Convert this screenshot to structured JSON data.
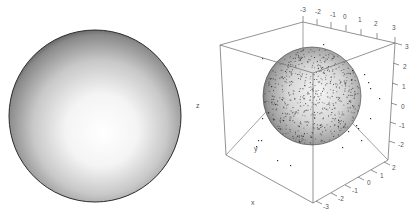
{
  "figure": {
    "panels": 2,
    "left_panel": {
      "description": "shaded sphere surface"
    },
    "right_panel": {
      "description": "3D scatter of points inside translucent sphere within bounding box"
    }
  },
  "colors": {
    "box_line": "#777777",
    "tick_text": "#555555",
    "point": "#333333",
    "sphere_highlight": "#ffffff",
    "sphere_shadow": "#3a3a3a"
  },
  "chart_data": [
    {
      "type": "surface",
      "title": "",
      "shape": "sphere",
      "shading": "grayscale lit from front-center"
    },
    {
      "type": "scatter",
      "title": "",
      "dimensions": 3,
      "overlay": "sphere of radius ~2 centered at origin",
      "xlabel": "x",
      "ylabel": "y",
      "zlabel": "z",
      "xlim": [
        -3,
        3
      ],
      "ylim": [
        -3,
        3
      ],
      "zlim": [
        -3,
        3
      ],
      "x_ticks": [
        "-3",
        "-2",
        "-1",
        "0",
        "1",
        "2"
      ],
      "y_ticks": [
        "-3",
        "-2",
        "-1",
        "0",
        "1",
        "2",
        "3"
      ],
      "z_ticks": [
        "3",
        "2",
        "1",
        "0",
        "-1",
        "-2"
      ],
      "grid": false,
      "legend": "none",
      "n_points_approx": 1000
    }
  ],
  "labels": {
    "x": "x",
    "y": "y",
    "z": "z"
  },
  "ticks": {
    "top": [
      "-3",
      "-2",
      "-1",
      "0",
      "1",
      "2",
      "3"
    ],
    "right": [
      "3",
      "2",
      "1",
      "0",
      "-1",
      "-2"
    ],
    "bottom": [
      "2",
      "1",
      "0",
      "-1",
      "-2",
      "-3"
    ]
  }
}
